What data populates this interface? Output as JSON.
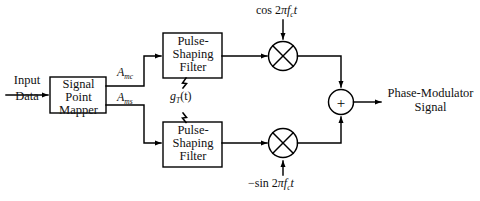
{
  "diagram": {
    "input": {
      "line1": "Input",
      "line2": "Data"
    },
    "mapper": {
      "line1": "Signal",
      "line2": "Point",
      "line3": "Mapper"
    },
    "branches": [
      {
        "amplitude_symbol": "A",
        "amplitude_subscript": "mc",
        "filter": {
          "line1": "Pulse-",
          "line2": "Shaping",
          "line3": "Filter"
        },
        "carrier_prefix": "cos ",
        "carrier_two": "2",
        "carrier_pi": "π",
        "carrier_f": "f",
        "carrier_sub": "c",
        "carrier_t": "t"
      },
      {
        "amplitude_symbol": "A",
        "amplitude_subscript": "ms",
        "filter": {
          "line1": "Pulse-",
          "line2": "Shaping",
          "line3": "Filter"
        },
        "carrier_prefix": "−sin ",
        "carrier_two": "2",
        "carrier_pi": "π",
        "carrier_f": "f",
        "carrier_sub": "c",
        "carrier_t": "t"
      }
    ],
    "pulse_shape": {
      "symbol": "g",
      "subscript": "T",
      "arg": "(t)"
    },
    "summer": {
      "symbol": "+"
    },
    "multiplier": {
      "symbol": "⊗"
    },
    "output": {
      "line1": "Phase-Modulator",
      "line2": "Signal"
    },
    "colors": {
      "background": "#ffffff",
      "stroke": "#000000",
      "text": "#111111"
    }
  }
}
